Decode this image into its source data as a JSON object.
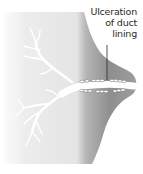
{
  "diagram": {
    "label": {
      "line1": "Ulceration",
      "line2": "of duct",
      "line3": "lining"
    },
    "colors": {
      "background": "#ffffff",
      "tissue_light": "#efefef",
      "tissue_dark": "#8a8a8a",
      "duct": "#ffffff",
      "text": "#2a2a2a"
    }
  }
}
